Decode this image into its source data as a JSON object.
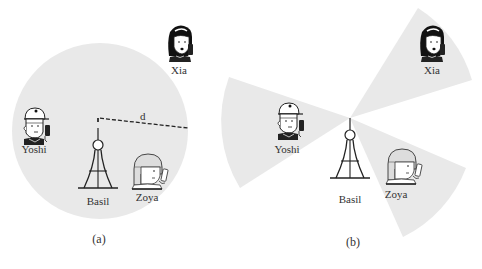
{
  "figure": {
    "panels": [
      {
        "id": "a",
        "caption": "(a)",
        "description": "Omnidirectional broadcast coverage",
        "coverage_shape": "circle",
        "distance_label": "d",
        "tower_label": "Basil",
        "users": [
          {
            "name": "Yoshi",
            "in_coverage": true
          },
          {
            "name": "Zoya",
            "in_coverage": true
          },
          {
            "name": "Xia",
            "in_coverage": false
          }
        ]
      },
      {
        "id": "b",
        "caption": "(b)",
        "description": "Directional beams toward each user",
        "coverage_shape": "sectors",
        "tower_label": "Basil",
        "users": [
          {
            "name": "Yoshi",
            "in_coverage": true
          },
          {
            "name": "Xia",
            "in_coverage": true
          },
          {
            "name": "Zoya",
            "in_coverage": true
          }
        ]
      }
    ],
    "colors": {
      "coverage_fill": "#e9e9e9",
      "line": "#222222",
      "background": "#ffffff"
    }
  }
}
